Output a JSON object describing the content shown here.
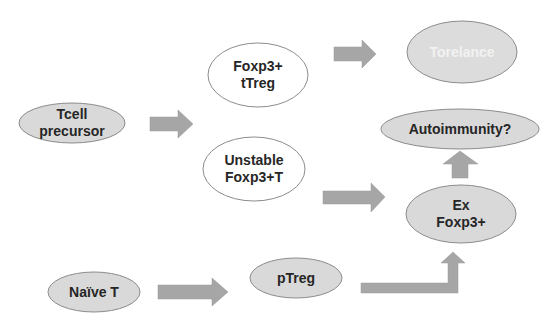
{
  "colors": {
    "node_fill": "#d9d9d9",
    "node_fill_white": "#ffffff",
    "node_fill_light": "#dcdcdc",
    "node_border": "#8c8c8c",
    "arrow_fill": "#a6a6a6",
    "text": "#262626",
    "text_light": "#f2f2f2"
  },
  "nodes": {
    "tcell_precursor": {
      "line1": "Tcell",
      "line2": "precursor"
    },
    "foxp3_ttreg": {
      "line1": "Foxp3+",
      "line2": "tTreg"
    },
    "unstable_foxp3": {
      "line1": "Unstable",
      "line2": "Foxp3+T"
    },
    "torelance": {
      "label": "Torelance"
    },
    "autoimmunity": {
      "label": "Autoimmunity?"
    },
    "ex_foxp3": {
      "line1": "Ex",
      "line2": "Foxp3+"
    },
    "naive_t": {
      "label": "Naïve T"
    },
    "ptreg": {
      "label": "pTreg"
    }
  },
  "edges": [
    {
      "from": "Tcell precursor",
      "to": "Foxp3+ tTreg / Unstable Foxp3+T"
    },
    {
      "from": "Foxp3+ tTreg",
      "to": "Torelance"
    },
    {
      "from": "Unstable Foxp3+T",
      "to": "Ex Foxp3+"
    },
    {
      "from": "Ex Foxp3+",
      "to": "Autoimmunity?"
    },
    {
      "from": "Naïve T",
      "to": "pTreg"
    },
    {
      "from": "pTreg",
      "to": "Ex Foxp3+"
    }
  ]
}
